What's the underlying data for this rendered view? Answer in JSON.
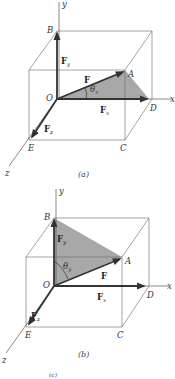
{
  "figures": [
    {
      "id": "a",
      "caption": "(a)",
      "axes": {
        "x": "x",
        "y": "y",
        "z": "z"
      },
      "points": {
        "O": "O",
        "A": "A",
        "B": "B",
        "C": "C",
        "D": "D",
        "E": "E"
      },
      "vectors": {
        "F": "F",
        "Fx": "F",
        "Fx_sub": "x",
        "Fy": "F",
        "Fy_sub": "y",
        "Fz": "F",
        "Fz_sub": "z"
      },
      "angle": {
        "symbol": "θ",
        "sub": "x"
      },
      "shaded_triangle": "O-A-D"
    },
    {
      "id": "b",
      "caption": "(b)",
      "axes": {
        "x": "x",
        "y": "y",
        "z": "z"
      },
      "points": {
        "O": "O",
        "A": "A",
        "B": "B",
        "C": "C",
        "D": "D",
        "E": "E"
      },
      "vectors": {
        "F": "F",
        "Fx": "F",
        "Fx_sub": "x",
        "Fy": "F",
        "Fy_sub": "y",
        "Fz": "F",
        "Fz_sub": "z"
      },
      "angle": {
        "symbol": "θ",
        "sub": "y"
      },
      "shaded_triangle": "O-B-A"
    }
  ],
  "footer_fragment": "(c)",
  "colors": {
    "shade": "#a8a8a8",
    "line": "#555555",
    "vector": "#333333"
  }
}
